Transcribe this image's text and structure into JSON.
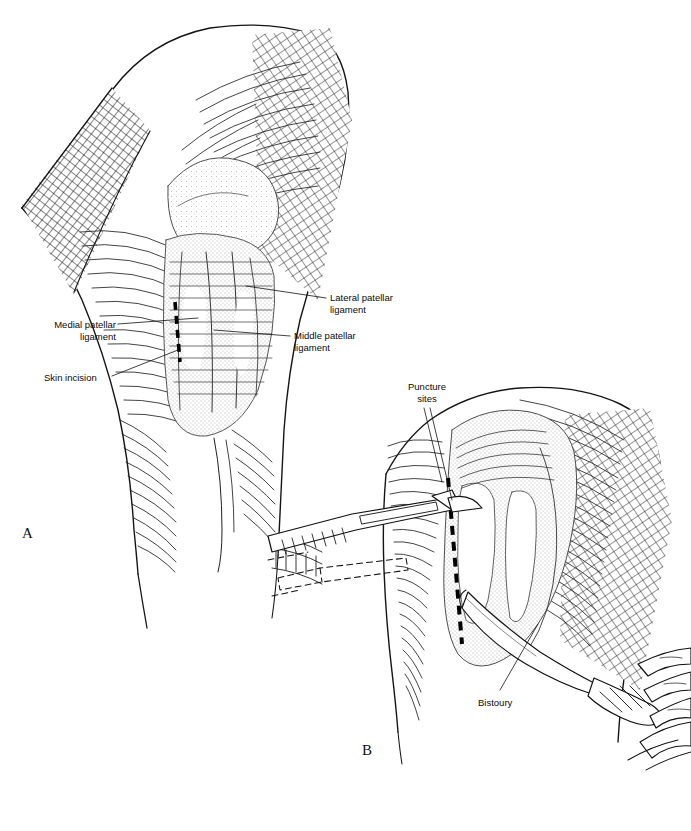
{
  "figure": {
    "kind": "line-art-illustration",
    "background_color": "#ffffff",
    "ink_color": "#111111",
    "width": 691,
    "height": 831
  },
  "panels": [
    {
      "id": "A",
      "letter": "A",
      "x": 22,
      "y": 525
    },
    {
      "id": "B",
      "letter": "B",
      "x": 362,
      "y": 742
    }
  ],
  "labels": [
    {
      "id": "lateral-patellar-ligament",
      "text": "Lateral patellar\nligament",
      "x": 330,
      "y": 292,
      "align": "left",
      "panel": "A"
    },
    {
      "id": "middle-patellar-ligament",
      "text": "Middle patellar\nligament",
      "x": 294,
      "y": 330,
      "align": "left",
      "panel": "A"
    },
    {
      "id": "medial-patellar-ligament",
      "text": "Medial patellar\nligament",
      "x": 18,
      "y": 319,
      "align": "right",
      "panel": "A"
    },
    {
      "id": "skin-incision",
      "text": "Skin incision",
      "x": 44,
      "y": 372,
      "align": "left",
      "panel": "A"
    },
    {
      "id": "puncture-sites",
      "text": "Puncture\nsites",
      "x": 396,
      "y": 386,
      "align": "center",
      "panel": "B"
    },
    {
      "id": "bistoury",
      "text": "Bistoury",
      "x": 478,
      "y": 697,
      "align": "left",
      "panel": "B"
    }
  ],
  "annotations": {
    "skin_incision_dash_a": "vertical dashed line over medial stifle, panel A",
    "skin_incision_dash_b": "vertical dashed line over medial stifle, panel B",
    "instruments": [
      "scalpel",
      "bistoury"
    ],
    "hand": "gloved hand gripping bistoury, lower right of panel B"
  }
}
